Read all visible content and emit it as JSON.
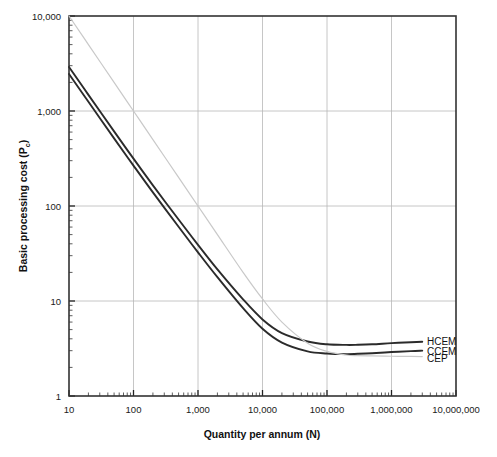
{
  "chart_data": {
    "type": "line",
    "title": "",
    "xlabel": "Quantity per annum (N)",
    "ylabel": "Basic processing cost (P_c)",
    "ylabel_main": "Basic processing cost (P",
    "ylabel_sub": "c",
    "ylabel_tail": ")",
    "xscale": "log",
    "yscale": "log",
    "xlim": [
      10,
      10000000
    ],
    "ylim": [
      1,
      10000
    ],
    "grid": true,
    "legend_position": "right-inline-labels",
    "xticks": [
      10,
      100,
      1000,
      10000,
      100000,
      1000000,
      10000000
    ],
    "xtick_labels": [
      "10",
      "100",
      "1,000",
      "10,000",
      "100,000",
      "1,000,000",
      "10,000,000"
    ],
    "yticks": [
      1,
      10,
      100,
      1000,
      10000
    ],
    "ytick_labels": [
      "1",
      "10",
      "100",
      "1,000",
      "10,000"
    ],
    "series": [
      {
        "name": "HCEM",
        "color": "#2b2b2b",
        "width": 1.9,
        "x": [
          10,
          20,
          50,
          100,
          200,
          500,
          1000,
          2000,
          5000,
          10000,
          20000,
          50000,
          100000,
          200000,
          300000,
          500000,
          1000000,
          2000000,
          3000000
        ],
        "y": [
          2900,
          1480,
          610,
          315,
          165,
          72,
          39,
          21.5,
          10.4,
          6.4,
          4.6,
          3.75,
          3.5,
          3.45,
          3.46,
          3.5,
          3.6,
          3.68,
          3.72
        ]
      },
      {
        "name": "CCEM",
        "color": "#2b2b2b",
        "width": 1.9,
        "x": [
          10,
          20,
          50,
          100,
          200,
          500,
          1000,
          2000,
          5000,
          10000,
          20000,
          50000,
          100000,
          200000,
          300000,
          500000,
          1000000,
          2000000,
          3000000
        ],
        "y": [
          2450,
          1250,
          515,
          266,
          139,
          60.5,
          32.5,
          17.8,
          8.4,
          5.1,
          3.65,
          2.95,
          2.8,
          2.76,
          2.78,
          2.82,
          2.9,
          2.97,
          3.0
        ]
      },
      {
        "name": "CEP",
        "color": "#c9c9c9",
        "width": 1.2,
        "x": [
          10,
          20,
          50,
          100,
          200,
          500,
          1000,
          2000,
          5000,
          10000,
          20000,
          50000,
          100000,
          200000,
          300000,
          500000,
          1000000,
          2000000,
          3000000
        ],
        "y": [
          10000,
          5000,
          2000,
          1000,
          500,
          200,
          100,
          50,
          20,
          10.5,
          6.0,
          3.6,
          2.95,
          2.7,
          2.66,
          2.64,
          2.62,
          2.61,
          2.6
        ]
      }
    ],
    "annotations": [
      {
        "name": "HCEM",
        "label": "HCEM"
      },
      {
        "name": "CCEM",
        "label": "CCEM"
      },
      {
        "name": "CEP",
        "label": "CEP"
      }
    ]
  }
}
